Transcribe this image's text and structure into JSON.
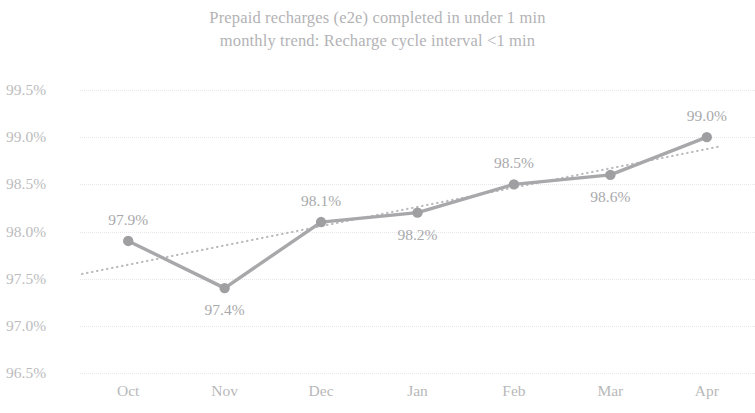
{
  "chart_data": {
    "type": "line",
    "title": "Prepaid recharges (e2e) completed in under 1 min monthly trend: Recharge cycle interval <1 min",
    "title_lines": [
      "Prepaid recharges (e2e) completed in under 1 min",
      "monthly trend: Recharge cycle interval <1 min"
    ],
    "xlabel": "",
    "ylabel": "",
    "categories": [
      "Oct",
      "Nov",
      "Dec",
      "Jan",
      "Feb",
      "Mar",
      "Apr"
    ],
    "values": [
      97.9,
      97.4,
      98.1,
      98.2,
      98.5,
      98.6,
      99.0
    ],
    "point_labels": [
      "97.9%",
      "97.4%",
      "98.1%",
      "98.2%",
      "98.5%",
      "98.6%",
      "99.0%"
    ],
    "label_positions": [
      "above",
      "below",
      "above",
      "below",
      "above",
      "below",
      "above"
    ],
    "ylim": [
      96.5,
      99.5
    ],
    "ytick_values": [
      99.5,
      99.0,
      98.5,
      98.0,
      97.5,
      97.0,
      96.5
    ],
    "ytick_labels": [
      "99.5%",
      "99.0%",
      "98.5%",
      "98.0%",
      "97.5%",
      "97.0%",
      "96.5%"
    ],
    "grid": true,
    "grid_orientation": "horizontal",
    "legend": false,
    "legend_position": "none",
    "series": [
      {
        "name": "Recharge cycle interval <1 min",
        "type": "line",
        "marker": "circle",
        "color": "#a8a8ab",
        "values": [
          97.9,
          97.4,
          98.1,
          98.2,
          98.5,
          98.6,
          99.0
        ]
      },
      {
        "name": "Linear trendline",
        "type": "trendline",
        "style": "dotted",
        "color": "#bdbdc0",
        "endpoints": [
          97.55,
          98.9
        ]
      }
    ]
  },
  "colors": {
    "line": "#a8a8ab",
    "marker": "#9f9fa2",
    "trendline": "#bdbdc0",
    "gridline": "#e7e7e9",
    "text": "#b7b7ba",
    "background": "#ffffff"
  }
}
